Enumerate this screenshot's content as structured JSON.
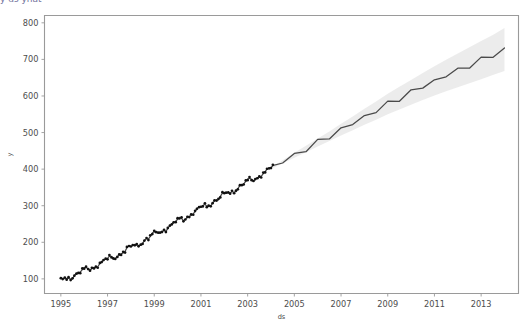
{
  "figure": {
    "background_color": "#ffffff",
    "clipped_header_text": "y    ds    yhat"
  },
  "axes": {
    "x_title": "ds",
    "y_title": "y",
    "x_ticks": [
      "1995",
      "1997",
      "1999",
      "2001",
      "2003",
      "2005",
      "2007",
      "2009",
      "2011",
      "2013"
    ],
    "y_ticks": [
      "100",
      "200",
      "300",
      "400",
      "500",
      "600",
      "700",
      "800"
    ],
    "spine_color": "#9a9a9a",
    "tick_color": "#4d4d4d"
  },
  "style": {
    "history_point_color": "#111111",
    "forecast_line_color": "#4a4a4a",
    "uncertainty_fill_color": "#e9e9e9"
  },
  "chart_data": {
    "type": "line",
    "title": "",
    "xlabel": "ds",
    "ylabel": "y",
    "xlim": [
      1994.3,
      2014.6
    ],
    "ylim": [
      60,
      820
    ],
    "grid": false,
    "legend": null,
    "history_end_x": 2004.1,
    "series": [
      {
        "name": "y (observed history)",
        "kind": "scatter",
        "x": [
          1995.0,
          1995.08,
          1995.17,
          1995.25,
          1995.33,
          1995.42,
          1995.5,
          1995.58,
          1995.67,
          1995.75,
          1995.83,
          1995.92,
          1996.0,
          1996.08,
          1996.17,
          1996.25,
          1996.33,
          1996.42,
          1996.5,
          1996.58,
          1996.67,
          1996.75,
          1996.83,
          1996.92,
          1997.0,
          1997.08,
          1997.17,
          1997.25,
          1997.33,
          1997.42,
          1997.5,
          1997.58,
          1997.67,
          1997.75,
          1997.83,
          1997.92,
          1998.0,
          1998.08,
          1998.17,
          1998.25,
          1998.33,
          1998.42,
          1998.5,
          1998.58,
          1998.67,
          1998.75,
          1998.83,
          1998.92,
          1999.0,
          1999.08,
          1999.17,
          1999.25,
          1999.33,
          1999.42,
          1999.5,
          1999.58,
          1999.67,
          1999.75,
          1999.83,
          1999.92,
          2000.0,
          2000.08,
          2000.17,
          2000.25,
          2000.33,
          2000.42,
          2000.5,
          2000.58,
          2000.67,
          2000.75,
          2000.83,
          2000.92,
          2001.0,
          2001.08,
          2001.17,
          2001.25,
          2001.33,
          2001.42,
          2001.5,
          2001.58,
          2001.67,
          2001.75,
          2001.83,
          2001.92,
          2002.0,
          2002.08,
          2002.17,
          2002.25,
          2002.33,
          2002.42,
          2002.5,
          2002.58,
          2002.67,
          2002.75,
          2002.83,
          2002.92,
          2003.0,
          2003.08,
          2003.17,
          2003.25,
          2003.33,
          2003.42,
          2003.5,
          2003.58,
          2003.67,
          2003.75,
          2003.83,
          2003.92,
          2004.0,
          2004.08
        ],
        "y": [
          96,
          99,
          101,
          100,
          104,
          107,
          108,
          112,
          114,
          113,
          117,
          120,
          122,
          126,
          128,
          127,
          131,
          135,
          137,
          140,
          143,
          142,
          147,
          150,
          152,
          156,
          158,
          157,
          162,
          166,
          168,
          172,
          175,
          174,
          179,
          183,
          185,
          189,
          192,
          191,
          196,
          200,
          203,
          207,
          210,
          209,
          214,
          218,
          221,
          225,
          228,
          227,
          232,
          236,
          239,
          243,
          246,
          245,
          250,
          254,
          257,
          261,
          264,
          263,
          268,
          272,
          275,
          279,
          282,
          281,
          286,
          290,
          293,
          297,
          300,
          299,
          304,
          308,
          311,
          315,
          318,
          317,
          322,
          326,
          329,
          333,
          336,
          335,
          340,
          344,
          347,
          351,
          354,
          353,
          358,
          362,
          365,
          369,
          372,
          371,
          376,
          380,
          383,
          387,
          390,
          389,
          394,
          398,
          401,
          404
        ]
      },
      {
        "name": "yhat (forecast)",
        "kind": "line",
        "x": [
          2004.1,
          2004.5,
          2005.0,
          2005.5,
          2006.0,
          2006.5,
          2007.0,
          2007.5,
          2008.0,
          2008.5,
          2009.0,
          2009.5,
          2010.0,
          2010.5,
          2011.0,
          2011.5,
          2012.0,
          2012.5,
          2013.0,
          2013.5,
          2014.0
        ],
        "y": [
          405,
          420,
          438,
          455,
          473,
          490,
          508,
          525,
          543,
          560,
          578,
          594,
          610,
          626,
          641,
          656,
          670,
          684,
          698,
          712,
          727
        ]
      },
      {
        "name": "yhat_lower",
        "kind": "band-lower",
        "x": [
          2004.1,
          2004.5,
          2005.0,
          2005.5,
          2006.0,
          2006.5,
          2007.0,
          2007.5,
          2008.0,
          2008.5,
          2009.0,
          2009.5,
          2010.0,
          2010.5,
          2011.0,
          2011.5,
          2012.0,
          2012.5,
          2013.0,
          2013.5,
          2014.0
        ],
        "y": [
          403,
          416,
          431,
          446,
          462,
          477,
          492,
          506,
          521,
          535,
          550,
          563,
          576,
          589,
          601,
          613,
          624,
          635,
          646,
          657,
          668
        ]
      },
      {
        "name": "yhat_upper",
        "kind": "band-upper",
        "x": [
          2004.1,
          2004.5,
          2005.0,
          2005.5,
          2006.0,
          2006.5,
          2007.0,
          2007.5,
          2008.0,
          2008.5,
          2009.0,
          2009.5,
          2010.0,
          2010.5,
          2011.0,
          2011.5,
          2012.0,
          2012.5,
          2013.0,
          2013.5,
          2014.0
        ],
        "y": [
          407,
          424,
          445,
          464,
          484,
          503,
          524,
          544,
          565,
          585,
          606,
          625,
          644,
          663,
          681,
          699,
          716,
          733,
          750,
          767,
          786
        ]
      }
    ]
  }
}
